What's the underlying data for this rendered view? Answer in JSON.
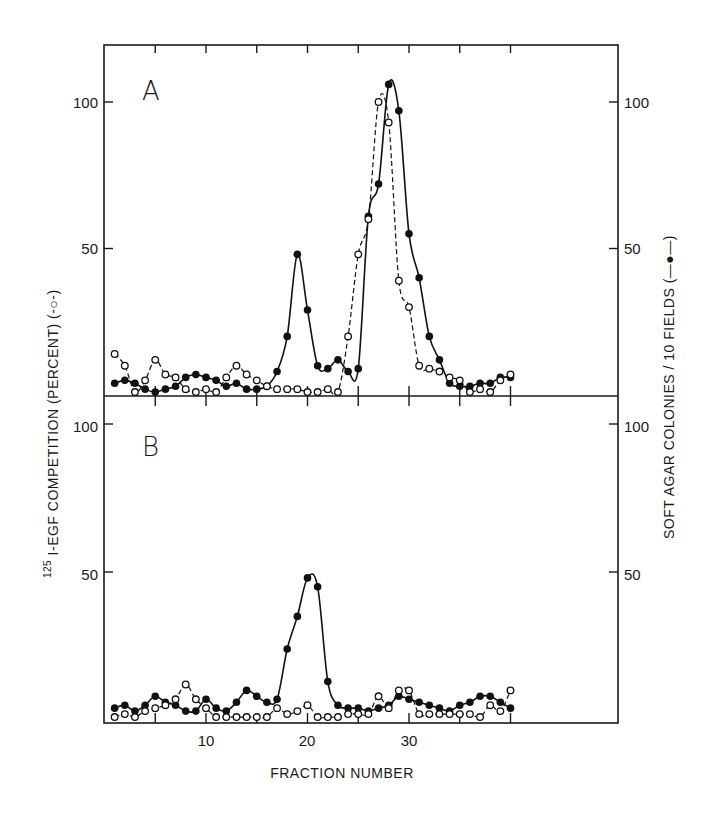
{
  "chart_data": [
    {
      "type": "line",
      "panel": "A",
      "panel_label": "A",
      "xlabel": "FRACTION NUMBER",
      "ylabel_left": "125I-EGF COMPETITION (PERCENT) (-o-)",
      "ylabel_right": "SOFT AGAR COLONIES / 10 FIELDS (-●-)",
      "ylim": [
        0,
        110
      ],
      "xlim": [
        0,
        40
      ],
      "yticks": [
        50,
        100
      ],
      "ytick_labels": [
        "50",
        "100"
      ],
      "x": [
        1,
        2,
        3,
        4,
        5,
        6,
        7,
        8,
        9,
        10,
        11,
        12,
        13,
        14,
        15,
        16,
        17,
        18,
        19,
        20,
        21,
        22,
        23,
        24,
        25,
        26,
        27,
        28,
        29,
        30,
        31,
        32,
        33,
        34,
        35,
        36,
        37,
        38,
        39,
        40
      ],
      "series": [
        {
          "name": "Soft agar colonies / 10 fields",
          "marker": "filled-circle",
          "line": "solid",
          "values": [
            4,
            5,
            4,
            2,
            1,
            2,
            3,
            6,
            7,
            6,
            5,
            3,
            4,
            2,
            2,
            3,
            8,
            20,
            48,
            29,
            10,
            9,
            12,
            8,
            9,
            61,
            72,
            106,
            97,
            55,
            40,
            20,
            12,
            4,
            3,
            3,
            4,
            4,
            6,
            6
          ]
        },
        {
          "name": "125I-EGF competition (percent)",
          "marker": "open-circle",
          "line": "dashed",
          "values": [
            14,
            10,
            1,
            5,
            12,
            7,
            6,
            2,
            1,
            2,
            1,
            6,
            10,
            7,
            5,
            3,
            2,
            2,
            2,
            1,
            1,
            2,
            1,
            20,
            48,
            60,
            100,
            93,
            39,
            30,
            10,
            9,
            8,
            6,
            5,
            1,
            2,
            1,
            5,
            7
          ]
        }
      ]
    },
    {
      "type": "line",
      "panel": "B",
      "panel_label": "B",
      "xlabel": "FRACTION NUMBER",
      "ylabel_left": "125I-EGF COMPETITION (PERCENT) (-o-)",
      "ylabel_right": "SOFT AGAR COLONIES / 10 FIELDS (-●-)",
      "ylim": [
        0,
        110
      ],
      "xlim": [
        0,
        40
      ],
      "xticks": [
        10,
        20,
        30
      ],
      "xtick_labels": [
        "10",
        "20",
        "30"
      ],
      "yticks": [
        50,
        100
      ],
      "ytick_labels": [
        "50",
        "100"
      ],
      "x": [
        1,
        2,
        3,
        4,
        5,
        6,
        7,
        8,
        9,
        10,
        11,
        12,
        13,
        14,
        15,
        16,
        17,
        18,
        19,
        20,
        21,
        22,
        23,
        24,
        25,
        26,
        27,
        28,
        29,
        30,
        31,
        32,
        33,
        34,
        35,
        36,
        37,
        38,
        39,
        40
      ],
      "series": [
        {
          "name": "Soft agar colonies / 10 fields",
          "marker": "filled-circle",
          "line": "solid",
          "values": [
            4,
            5,
            3,
            5,
            8,
            6,
            5,
            3,
            3,
            7,
            4,
            3,
            6,
            10,
            8,
            6,
            7,
            24,
            35,
            48,
            45,
            13,
            5,
            4,
            4,
            3,
            4,
            5,
            8,
            7,
            6,
            5,
            4,
            3,
            5,
            6,
            8,
            8,
            6,
            4
          ]
        },
        {
          "name": "125I-EGF competition (percent)",
          "marker": "open-circle",
          "line": "dashed",
          "values": [
            1,
            2,
            1,
            3,
            4,
            5,
            7,
            12,
            7,
            4,
            1,
            1,
            1,
            1,
            1,
            1,
            4,
            2,
            3,
            5,
            1,
            1,
            1,
            2,
            2,
            2,
            8,
            4,
            10,
            10,
            2,
            2,
            2,
            2,
            2,
            2,
            1,
            5,
            3,
            10
          ]
        }
      ]
    }
  ],
  "labels": {
    "panel_a": "A",
    "panel_b": "B",
    "x_axis_title": "FRACTION NUMBER",
    "left_axis_title_sup": "125",
    "left_axis_title": "I-EGF COMPETITION  (PERCENT)  (-○-)",
    "right_axis_title": "SOFT AGAR COLONIES / 10 FIELDS (—●—)",
    "ytick_50": "50",
    "ytick_100": "100",
    "xtick_10": "10",
    "xtick_20": "20",
    "xtick_30": "30"
  }
}
